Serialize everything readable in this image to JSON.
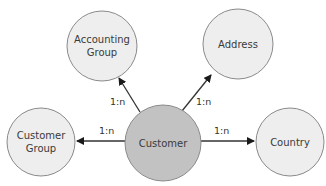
{
  "diagram": {
    "type": "entity-relationship",
    "colors": {
      "node_fill": "#eeeeee",
      "node_stroke": "#8a8a8a",
      "center_fill": "#c2c2c2",
      "edge": "#333333",
      "text": "#3a3a3a"
    },
    "nodes": [
      {
        "id": "customer",
        "label_lines": [
          "Customer"
        ],
        "cx": 163,
        "cy": 143,
        "r": 38,
        "center": true
      },
      {
        "id": "accounting_group",
        "label_lines": [
          "Accounting",
          "Group"
        ],
        "cx": 102,
        "cy": 46,
        "r": 35
      },
      {
        "id": "address",
        "label_lines": [
          "Address"
        ],
        "cx": 238,
        "cy": 44,
        "r": 35
      },
      {
        "id": "customer_group",
        "label_lines": [
          "Customer",
          "Group"
        ],
        "cx": 41,
        "cy": 142,
        "r": 34
      },
      {
        "id": "country",
        "label_lines": [
          "Country"
        ],
        "cx": 290,
        "cy": 142,
        "r": 34
      }
    ],
    "edges": [
      {
        "from": "customer",
        "to": "accounting_group",
        "cardinality": "1:n",
        "x1": 140,
        "y1": 112,
        "x2": 119,
        "y2": 78,
        "label_x": 110,
        "label_y": 105
      },
      {
        "from": "customer",
        "to": "address",
        "cardinality": "1:n",
        "x1": 182,
        "y1": 111,
        "x2": 211,
        "y2": 75,
        "label_x": 196,
        "label_y": 105
      },
      {
        "from": "customer",
        "to": "customer_group",
        "cardinality": "1:n",
        "x1": 125,
        "y1": 141,
        "x2": 77,
        "y2": 141,
        "label_x": 99,
        "label_y": 134
      },
      {
        "from": "customer",
        "to": "country",
        "cardinality": "1:n",
        "x1": 201,
        "y1": 141,
        "x2": 254,
        "y2": 141,
        "label_x": 214,
        "label_y": 134
      }
    ]
  }
}
